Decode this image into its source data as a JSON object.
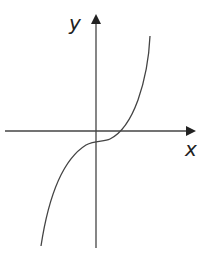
{
  "diagram": {
    "type": "function-graph",
    "axes": {
      "x_label": "x",
      "y_label": "y"
    },
    "colors": {
      "axis": "#333333",
      "curve": "#333333",
      "background": "#ffffff"
    }
  }
}
